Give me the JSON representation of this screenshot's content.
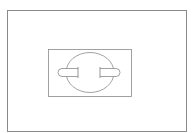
{
  "diagram": {
    "stroke_color": "#8a8a8a",
    "background_color": "#ffffff",
    "elements": [
      {
        "name": "outer-frame",
        "shape": "rectangle"
      },
      {
        "name": "inner-plate",
        "shape": "rectangle"
      },
      {
        "name": "socket-circle",
        "shape": "circle"
      },
      {
        "name": "left-pin",
        "shape": "rounded-tab"
      },
      {
        "name": "right-pin",
        "shape": "rounded-tab"
      }
    ]
  }
}
